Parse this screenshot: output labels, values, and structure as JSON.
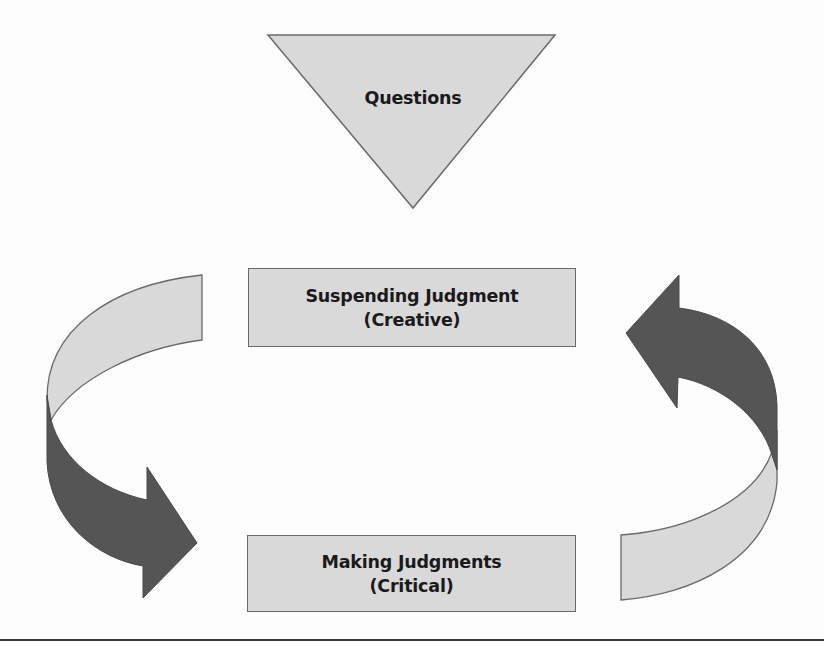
{
  "diagram": {
    "triangle": {
      "label": "Questions"
    },
    "top_box": {
      "line1": "Suspending Judgment",
      "line2": "(Creative)"
    },
    "bottom_box": {
      "line1": "Making Judgments",
      "line2": "(Critical)"
    },
    "arrows": {
      "left": {
        "direction": "down",
        "from": "top_box",
        "to": "bottom_box"
      },
      "right": {
        "direction": "up",
        "from": "bottom_box",
        "to": "top_box"
      }
    }
  },
  "colors": {
    "light_fill": "#d9d9d9",
    "dark_fill": "#555555",
    "stroke": "#6a6a6a",
    "text": "#1a1a1a",
    "background": "#fdfdfd"
  }
}
